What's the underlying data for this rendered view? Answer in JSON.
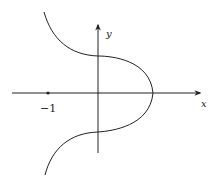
{
  "figure": {
    "axes": {
      "x_label": "x",
      "y_label": "y"
    },
    "tick_labels": {
      "minus_one": "−1"
    },
    "colors": {
      "stroke": "#222222",
      "background": "#ffffff"
    },
    "curve_description": "Sideways S/cubic-like curve: branches from upper-left and lower-left, flattening at the y-axis, bulging right to cross the x-axis at about x = 1.1"
  }
}
